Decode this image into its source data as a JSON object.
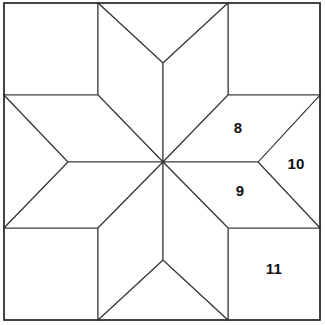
{
  "figure": {
    "type": "geometric-diagram",
    "width": 325,
    "height": 325,
    "background_color": "#ffffff",
    "line_color": "#3a3a3a",
    "border_color": "#2e2e2e",
    "label_color": "#111111"
  },
  "geometry": {
    "frame": {
      "left": 4,
      "top": 3,
      "right": 320,
      "bottom": 320
    },
    "center": {
      "x": 163,
      "y": 162
    },
    "grid_lines_x": [
      98,
      228
    ],
    "grid_lines_y": [
      95,
      228
    ],
    "inner_point_vertices": {
      "top": {
        "x": 163,
        "y": 63
      },
      "bottom": {
        "x": 163,
        "y": 260
      },
      "left": {
        "x": 68,
        "y": 162
      },
      "right": {
        "x": 258,
        "y": 162
      }
    }
  },
  "labels": [
    {
      "text": "8",
      "x": 238,
      "y": 127,
      "piece": "upper-right-diamond"
    },
    {
      "text": "10",
      "x": 296,
      "y": 163,
      "piece": "right-edge-triangle"
    },
    {
      "text": "9",
      "x": 240,
      "y": 190,
      "piece": "lower-right-diamond"
    },
    {
      "text": "11",
      "x": 274,
      "y": 268,
      "piece": "lower-right-corner-square"
    }
  ]
}
